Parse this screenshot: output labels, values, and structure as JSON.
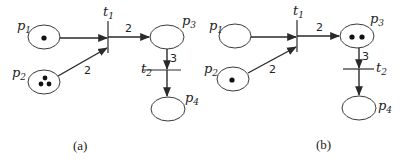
{
  "diagram": {
    "type": "petri-net",
    "panels": [
      {
        "id": "a",
        "caption": "(a)",
        "places": [
          {
            "name": "p",
            "sub": "1",
            "tokens": 1
          },
          {
            "name": "p",
            "sub": "2",
            "tokens": 3
          },
          {
            "name": "p",
            "sub": "3",
            "tokens": 0
          },
          {
            "name": "p",
            "sub": "4",
            "tokens": 0
          }
        ],
        "transitions": [
          {
            "name": "t",
            "sub": "1"
          },
          {
            "name": "t",
            "sub": "2"
          }
        ],
        "arcs": [
          {
            "from": "p1",
            "to": "t1",
            "weight": ""
          },
          {
            "from": "p2",
            "to": "t1",
            "weight": "2"
          },
          {
            "from": "t1",
            "to": "p3",
            "weight": "2"
          },
          {
            "from": "p3",
            "to": "t2",
            "weight": "3"
          },
          {
            "from": "t2",
            "to": "p4",
            "weight": ""
          }
        ]
      },
      {
        "id": "b",
        "caption": "(b)",
        "places": [
          {
            "name": "p",
            "sub": "1",
            "tokens": 0
          },
          {
            "name": "p",
            "sub": "2",
            "tokens": 1
          },
          {
            "name": "p",
            "sub": "3",
            "tokens": 2
          },
          {
            "name": "p",
            "sub": "4",
            "tokens": 0
          }
        ],
        "transitions": [
          {
            "name": "t",
            "sub": "1"
          },
          {
            "name": "t",
            "sub": "2"
          }
        ],
        "arcs": [
          {
            "from": "p1",
            "to": "t1",
            "weight": ""
          },
          {
            "from": "p2",
            "to": "t1",
            "weight": "2"
          },
          {
            "from": "t1",
            "to": "p3",
            "weight": "2"
          },
          {
            "from": "p3",
            "to": "t2",
            "weight": "3"
          },
          {
            "from": "t2",
            "to": "p4",
            "weight": ""
          }
        ]
      }
    ]
  }
}
